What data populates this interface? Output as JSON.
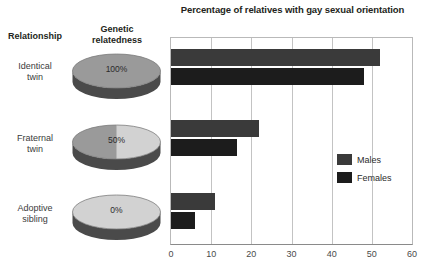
{
  "chart_data": {
    "type": "bar",
    "orientation": "horizontal",
    "title": "Percentage of relatives with gay sexual orientation",
    "xlabel": "",
    "ylabel": "",
    "xlim": [
      0,
      60
    ],
    "xticks": [
      0,
      10,
      20,
      30,
      40,
      50,
      60
    ],
    "xtick_labels": [
      "0",
      "10",
      "20",
      "30",
      "40",
      "50",
      "60"
    ],
    "grid": true,
    "grid_axis": "x",
    "legend_position": "center right",
    "categories": [
      "Identical twin",
      "Fraternal twin",
      "Adoptive sibling"
    ],
    "series": [
      {
        "name": "Males",
        "values": [
          52,
          22,
          11
        ],
        "color": "#3a3a3a"
      },
      {
        "name": "Females",
        "values": [
          48,
          16.5,
          6
        ],
        "color": "#1c1c1c"
      }
    ]
  },
  "title": "Percentage of relatives with gay sexual orientation",
  "columns": {
    "relationship_header": "Relationship",
    "genetic_header": "Genetic relatedness",
    "genetic_header_line1": "Genetic",
    "genetic_header_line2": "relatedness"
  },
  "rows": [
    {
      "relationship": "Identical twin",
      "relationship_line1": "Identical",
      "relationship_line2": "twin",
      "genetic_relatedness": "100%",
      "genetic_fraction": 1.0,
      "males": 52,
      "females": 48
    },
    {
      "relationship": "Fraternal twin",
      "relationship_line1": "Fraternal",
      "relationship_line2": "twin",
      "genetic_relatedness": "50%",
      "genetic_fraction": 0.5,
      "males": 22,
      "females": 16.5
    },
    {
      "relationship": "Adoptive sibling",
      "relationship_line1": "Adoptive",
      "relationship_line2": "sibling",
      "genetic_relatedness": "0%",
      "genetic_fraction": 0.0,
      "males": 11,
      "females": 6
    }
  ],
  "axis": {
    "ticks": [
      "0",
      "10",
      "20",
      "30",
      "40",
      "50",
      "60"
    ],
    "min": 0,
    "max": 60
  },
  "legend": {
    "items": [
      {
        "label": "Males",
        "color": "#3a3a3a"
      },
      {
        "label": "Females",
        "color": "#1c1c1c"
      }
    ]
  },
  "colors": {
    "bar_males": "#3a3a3a",
    "bar_females": "#1c1c1c",
    "disc_shaded": "#9a9a9a",
    "disc_unshaded": "#d2d2d2",
    "disc_side": "#4a4a4a",
    "gridline": "#c3c3c3",
    "text": "#231f20"
  }
}
